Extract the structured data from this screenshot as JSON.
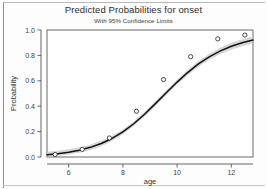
{
  "chart_data": {
    "type": "line",
    "title": "Predicted Probabilities for onset",
    "subtitle": "With 95% Confidence Limits",
    "xlabel": "age",
    "ylabel": "Probability",
    "xlim": [
      5.2,
      12.8
    ],
    "ylim": [
      0.0,
      1.0
    ],
    "grid": false,
    "legend": null,
    "x_ticks": [
      "6",
      "8",
      "10",
      "12"
    ],
    "x_tick_values": [
      6,
      8,
      10,
      12
    ],
    "y_ticks": [
      "0.0",
      "0.2",
      "0.4",
      "0.6",
      "0.8",
      "1.0"
    ],
    "y_tick_values": [
      0.0,
      0.2,
      0.4,
      0.6,
      0.8,
      1.0
    ],
    "series": [
      {
        "name": "Observed proportions",
        "type": "scatter",
        "marker": "open-circle",
        "x": [
          5.5,
          6.5,
          7.5,
          8.5,
          9.5,
          10.5,
          11.5,
          12.5
        ],
        "values": [
          0.02,
          0.06,
          0.15,
          0.36,
          0.61,
          0.79,
          0.93,
          0.96
        ]
      },
      {
        "name": "Predicted probability",
        "type": "line",
        "color": "#111111",
        "x": [
          5.2,
          5.6,
          6.0,
          6.4,
          6.8,
          7.2,
          7.6,
          8.0,
          8.4,
          8.8,
          9.2,
          9.6,
          10.0,
          10.4,
          10.8,
          11.2,
          11.6,
          12.0,
          12.4,
          12.8
        ],
        "values": [
          0.018,
          0.026,
          0.038,
          0.054,
          0.076,
          0.106,
          0.146,
          0.198,
          0.262,
          0.337,
          0.42,
          0.506,
          0.59,
          0.667,
          0.735,
          0.791,
          0.836,
          0.872,
          0.9,
          0.922
        ]
      },
      {
        "name": "95% upper confidence limit",
        "type": "band-upper",
        "color": "#c9c9c9",
        "x": [
          5.2,
          5.6,
          6.0,
          6.4,
          6.8,
          7.2,
          7.6,
          8.0,
          8.4,
          8.8,
          9.2,
          9.6,
          10.0,
          10.4,
          10.8,
          11.2,
          11.6,
          12.0,
          12.4,
          12.8
        ],
        "values": [
          0.042,
          0.05,
          0.062,
          0.077,
          0.098,
          0.127,
          0.166,
          0.217,
          0.281,
          0.356,
          0.439,
          0.525,
          0.61,
          0.688,
          0.757,
          0.815,
          0.862,
          0.899,
          0.928,
          0.95
        ]
      },
      {
        "name": "95% lower confidence limit",
        "type": "band-lower",
        "color": "#c9c9c9",
        "x": [
          5.2,
          5.6,
          6.0,
          6.4,
          6.8,
          7.2,
          7.6,
          8.0,
          8.4,
          8.8,
          9.2,
          9.6,
          10.0,
          10.4,
          10.8,
          11.2,
          11.6,
          12.0,
          12.4,
          12.8
        ],
        "values": [
          0.004,
          0.009,
          0.019,
          0.033,
          0.054,
          0.085,
          0.126,
          0.179,
          0.243,
          0.318,
          0.401,
          0.487,
          0.57,
          0.646,
          0.713,
          0.767,
          0.81,
          0.845,
          0.872,
          0.894
        ]
      }
    ]
  }
}
